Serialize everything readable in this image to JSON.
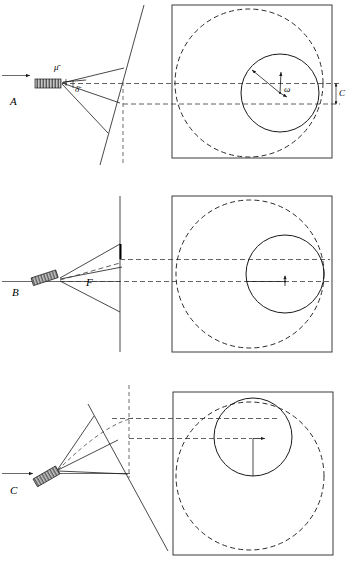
{
  "figure": {
    "width": 352,
    "height": 566,
    "background_color": "#ffffff",
    "ink_color": "#1a1a1a"
  },
  "panels": [
    {
      "id": "A",
      "label": "A",
      "label_position": {
        "x": 14,
        "y": 103
      },
      "source": {
        "name": "emitter-bar",
        "orientation_deg": 0,
        "x": 35,
        "y": 79,
        "width": 26,
        "height": 9,
        "hatched": true
      },
      "incoming_arrow": {
        "x1": 2,
        "y1": 75,
        "x2": 33,
        "y2": 75,
        "label": ""
      },
      "symbols": [
        {
          "name": "mu-bar",
          "text": "μ̄",
          "x": 57,
          "y": 71
        },
        {
          "name": "delta-bar",
          "text": "δ̄",
          "x": 77,
          "y": 90
        }
      ],
      "box": {
        "x": 172,
        "y": 5,
        "width": 160,
        "height": 153
      },
      "dashed_circle": {
        "cx": 249,
        "cy": 83,
        "r": 74
      },
      "solid_circle": {
        "cx": 280,
        "cy": 93,
        "r": 39
      },
      "angle_symbol": {
        "name": "omega",
        "text": "ω",
        "x": 286,
        "y": 91
      },
      "caliper": {
        "label": "C",
        "x": 341,
        "y": 95,
        "top": 83,
        "bottom": 103
      }
    },
    {
      "id": "B",
      "label": "B",
      "label_position": {
        "x": 16,
        "y": 293
      },
      "source": {
        "name": "emitter-bar",
        "orientation_deg": -18,
        "x": 31,
        "y": 278,
        "width": 26,
        "height": 8,
        "hatched": true
      },
      "symbols": [
        {
          "name": "focal-label-F",
          "text": "F",
          "x": 89,
          "y": 283
        }
      ],
      "box": {
        "x": 172,
        "y": 196,
        "width": 160,
        "height": 156
      },
      "dashed_circle": {
        "cx": 250,
        "cy": 274,
        "r": 74
      },
      "solid_circle": {
        "cx": 285,
        "cy": 274,
        "r": 39
      },
      "caliper": {
        "label": "",
        "x": 0,
        "y": 0,
        "top": 0,
        "bottom": 0
      }
    },
    {
      "id": "C",
      "label": "C",
      "label_position": {
        "x": 14,
        "y": 492
      },
      "source": {
        "name": "emitter-bar",
        "orientation_deg": -30,
        "x": 33,
        "y": 470,
        "width": 26,
        "height": 9,
        "hatched": true
      },
      "incoming_arrow": {
        "x1": 2,
        "y1": 473,
        "x2": 33,
        "y2": 473,
        "label": ""
      },
      "symbols": [],
      "box": {
        "x": 173,
        "y": 392,
        "width": 160,
        "height": 163
      },
      "dashed_circle": {
        "cx": 250,
        "cy": 476,
        "r": 74
      },
      "solid_circle": {
        "cx": 253,
        "cy": 437,
        "r": 39
      },
      "caliper": {
        "label": "",
        "x": 0,
        "y": 0,
        "top": 0,
        "bottom": 0
      }
    }
  ],
  "legend_symbols": {
    "mu_bar": "μ̄",
    "delta_bar": "δ̄",
    "omega": "ω",
    "focal_F": "F",
    "caliper_C": "C"
  }
}
